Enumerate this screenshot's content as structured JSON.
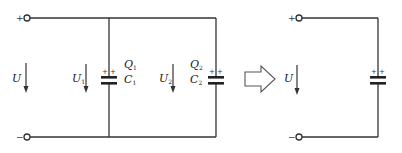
{
  "left_circuit": {
    "terminal_plus": "+",
    "terminal_minus": "−",
    "source_voltage": "U",
    "capacitor_1": {
      "voltage": "U",
      "voltage_sub": "1",
      "charge": "Q",
      "charge_sub": "1",
      "name": "C",
      "name_sub": "1"
    },
    "capacitor_2": {
      "voltage": "U",
      "voltage_sub": "2",
      "charge": "Q",
      "charge_sub": "2",
      "name": "C",
      "name_sub": "2"
    }
  },
  "transform_arrow": "equivalent",
  "right_circuit": {
    "terminal_plus": "+",
    "terminal_minus": "−",
    "source_voltage": "U"
  },
  "colors": {
    "wire": "#333333",
    "background": "#ffffff"
  }
}
